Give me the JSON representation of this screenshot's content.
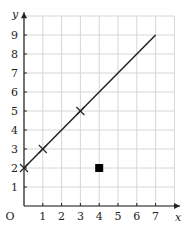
{
  "chart_data": {
    "type": "line",
    "title": "",
    "xlabel": "x",
    "ylabel": "y",
    "origin_label": "O",
    "xlim": [
      0,
      8
    ],
    "ylim": [
      0,
      10
    ],
    "grid": true,
    "x_ticks": [
      "1",
      "2",
      "3",
      "4",
      "5",
      "6",
      "7"
    ],
    "y_ticks": [
      "1",
      "2",
      "3",
      "4",
      "5",
      "6",
      "7",
      "8",
      "9"
    ],
    "series": [
      {
        "name": "line",
        "type": "line",
        "x": [
          0,
          7
        ],
        "y": [
          2,
          9
        ],
        "color": "#222222"
      },
      {
        "name": "crosses",
        "type": "scatter",
        "marker": "x",
        "x": [
          0,
          1,
          3
        ],
        "y": [
          2,
          3,
          5
        ],
        "color": "#222222"
      },
      {
        "name": "square",
        "type": "scatter",
        "marker": "square",
        "x": [
          4
        ],
        "y": [
          2
        ],
        "color": "#000000"
      }
    ]
  }
}
